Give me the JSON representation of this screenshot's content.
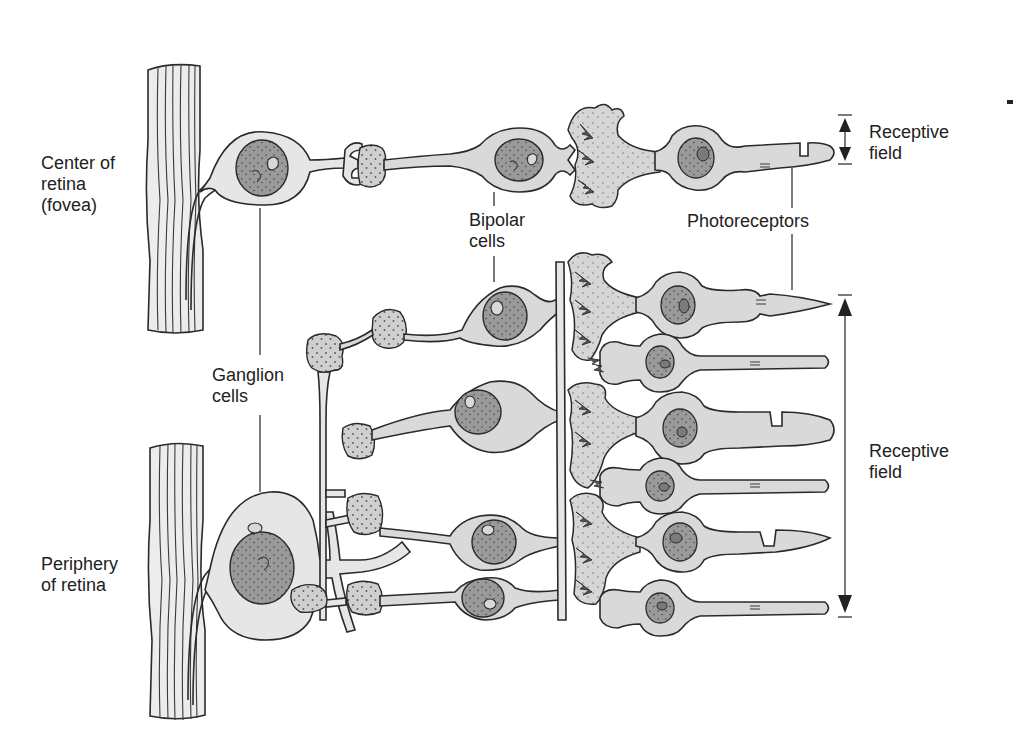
{
  "figure": {
    "type": "anatomical-diagram",
    "colors": {
      "background": "#ffffff",
      "cell_fill": "#d9d9d9",
      "nucleus_fill": "#9a9a9a",
      "outline": "#2a2a2a",
      "text": "#222222"
    }
  },
  "labels": {
    "center_region": "Center of\nretina\n(fovea)",
    "periphery_region": "Periphery\nof retina",
    "ganglion_cells": "Ganglion\ncells",
    "bipolar_cells": "Bipolar\ncells",
    "photoreceptors": "Photoreceptors",
    "receptive_field_top": "Receptive\nfield",
    "receptive_field_bottom": "Receptive\nfield"
  },
  "structure": {
    "center": {
      "ganglion_cells": 1,
      "bipolar_cells": 1,
      "photoreceptors": 1
    },
    "periphery": {
      "ganglion_cells": 1,
      "bipolar_cells": 4,
      "photoreceptors": 6
    }
  }
}
